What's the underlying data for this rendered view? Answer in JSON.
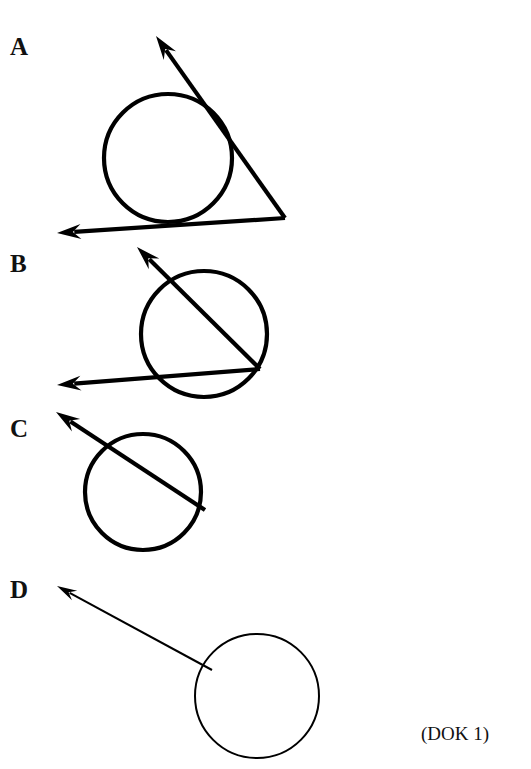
{
  "figure": {
    "caption": "(DOK 1)",
    "background_color": "#ffffff",
    "ink_color": "#000000",
    "width": 531,
    "height": 769,
    "options": [
      {
        "id": "A",
        "label": "A",
        "label_x": 10,
        "label_y": 55,
        "description": "two tangent rays from an external point touching the circle",
        "stroke_width": 4.2,
        "circle": {
          "cx": 168,
          "cy": 158,
          "r": 64
        },
        "rays": [
          {
            "name": "upper-tangent-ray",
            "from_x": 285,
            "from_y": 218,
            "to_x": 156,
            "to_y": 36,
            "arrow": true,
            "arrow_length": 24,
            "arrow_width": 15
          },
          {
            "name": "lower-tangent-ray",
            "from_x": 285,
            "from_y": 218,
            "to_x": 57,
            "to_y": 233,
            "arrow": true,
            "arrow_length": 24,
            "arrow_width": 15
          }
        ]
      },
      {
        "id": "B",
        "label": "B",
        "label_x": 10,
        "label_y": 272,
        "description": "two secant rays from a point on the circle cutting through the circle",
        "stroke_width": 4.2,
        "circle": {
          "cx": 204,
          "cy": 334,
          "r": 63
        },
        "rays": [
          {
            "name": "upper-secant-ray",
            "from_x": 260,
            "from_y": 369,
            "to_x": 137,
            "to_y": 247,
            "arrow": true,
            "arrow_length": 24,
            "arrow_width": 15
          },
          {
            "name": "lower-secant-ray",
            "from_x": 260,
            "from_y": 369,
            "to_x": 57,
            "to_y": 385,
            "arrow": true,
            "arrow_length": 24,
            "arrow_width": 15
          }
        ]
      },
      {
        "id": "C",
        "label": "C",
        "label_x": 10,
        "label_y": 437,
        "description": "one secant ray from a point on the circle through the circle",
        "stroke_width": 4.2,
        "circle": {
          "cx": 143,
          "cy": 492,
          "r": 58
        },
        "rays": [
          {
            "name": "secant-ray",
            "from_x": 205,
            "from_y": 510,
            "to_x": 56,
            "to_y": 412,
            "arrow": true,
            "arrow_length": 24,
            "arrow_width": 15
          }
        ]
      },
      {
        "id": "D",
        "label": "D",
        "label_x": 10,
        "label_y": 598,
        "description": "one thin ray from a point on the circle pointing away",
        "stroke_width": 2.0,
        "circle": {
          "cx": 257,
          "cy": 696,
          "r": 62
        },
        "rays": [
          {
            "name": "external-ray",
            "from_x": 212,
            "from_y": 670,
            "to_x": 57,
            "to_y": 586,
            "arrow": true,
            "arrow_length": 20,
            "arrow_width": 11
          }
        ]
      }
    ],
    "caption_x": 421,
    "caption_y": 740
  }
}
